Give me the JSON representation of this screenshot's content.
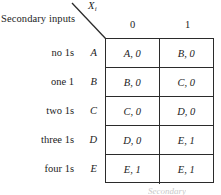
{
  "header": {
    "secondary_inputs_label": "Secondary inputs",
    "input_variable": "X",
    "input_variable_subscript": "i"
  },
  "columns": [
    {
      "label": "0"
    },
    {
      "label": "1"
    }
  ],
  "rows": [
    {
      "description": "no 1s",
      "state": "A",
      "cells": [
        "A, 0",
        "B, 0"
      ]
    },
    {
      "description": "one 1",
      "state": "B",
      "cells": [
        "B, 0",
        "C, 0"
      ]
    },
    {
      "description": "two 1s",
      "state": "C",
      "cells": [
        "C, 0",
        "D, 0"
      ]
    },
    {
      "description": "three 1s",
      "state": "D",
      "cells": [
        "D, 0",
        "E, 1"
      ]
    },
    {
      "description": "four 1s",
      "state": "E",
      "cells": [
        "E, 1",
        "E, 1"
      ]
    }
  ],
  "bottom_caption": "Secondary",
  "colors": {
    "border": "#2b2b2b",
    "text": "#1c1c1c",
    "background": "#ffffff"
  }
}
